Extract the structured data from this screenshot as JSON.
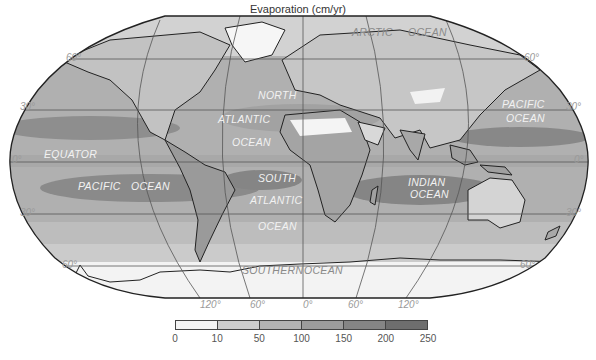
{
  "title": "Evaporation (cm/yr)",
  "map": {
    "projection": "Robinson-like world map",
    "ocean_labels": [
      {
        "id": "arctic",
        "text": "ARCTIC",
        "x": 352,
        "y": 36,
        "style": "dark"
      },
      {
        "id": "arctic-ocean",
        "text": "OCEAN",
        "x": 408,
        "y": 36,
        "style": "dark"
      },
      {
        "id": "north",
        "text": "NORTH",
        "x": 258,
        "y": 99,
        "style": "light"
      },
      {
        "id": "north-atlantic",
        "text": "ATLANTIC",
        "x": 218,
        "y": 123,
        "style": "light"
      },
      {
        "id": "north-ocean",
        "text": "OCEAN",
        "x": 232,
        "y": 146,
        "style": "light"
      },
      {
        "id": "pacific-ne",
        "text": "PACIFIC",
        "x": 502,
        "y": 108,
        "style": "light"
      },
      {
        "id": "pacific-ne-ocean",
        "text": "OCEAN",
        "x": 506,
        "y": 122,
        "style": "light"
      },
      {
        "id": "equator",
        "text": "EQUATOR",
        "x": 44,
        "y": 158,
        "style": "light"
      },
      {
        "id": "pacific",
        "text": "PACIFIC",
        "x": 78,
        "y": 190,
        "style": "light"
      },
      {
        "id": "pacific-ocean",
        "text": "OCEAN",
        "x": 131,
        "y": 190,
        "style": "light"
      },
      {
        "id": "south",
        "text": "SOUTH",
        "x": 258,
        "y": 182,
        "style": "light"
      },
      {
        "id": "south-atlantic",
        "text": "ATLANTIC",
        "x": 250,
        "y": 204,
        "style": "light"
      },
      {
        "id": "south-ocean",
        "text": "OCEAN",
        "x": 258,
        "y": 230,
        "style": "light"
      },
      {
        "id": "indian",
        "text": "INDIAN",
        "x": 408,
        "y": 186,
        "style": "light"
      },
      {
        "id": "indian-ocean",
        "text": "OCEAN",
        "x": 410,
        "y": 198,
        "style": "light"
      },
      {
        "id": "southern",
        "text": "SOUTHERN",
        "x": 242,
        "y": 274,
        "style": "dark"
      },
      {
        "id": "southern-ocean",
        "text": "OCEAN",
        "x": 304,
        "y": 274,
        "style": "dark"
      }
    ],
    "latitude_labels": [
      {
        "text": "60°",
        "x": 66,
        "y": 61
      },
      {
        "text": "30°",
        "x": 20,
        "y": 110
      },
      {
        "text": "0°",
        "x": 12,
        "y": 163
      },
      {
        "text": "30°",
        "x": 20,
        "y": 216
      },
      {
        "text": "60°",
        "x": 62,
        "y": 268
      },
      {
        "text": "60°",
        "x": 524,
        "y": 61
      },
      {
        "text": "30°",
        "x": 566,
        "y": 110
      },
      {
        "text": "0°",
        "x": 574,
        "y": 163
      },
      {
        "text": "30°",
        "x": 566,
        "y": 216
      },
      {
        "text": "60°",
        "x": 520,
        "y": 268
      }
    ],
    "longitude_labels": [
      {
        "text": "120°",
        "x": 200,
        "y": 308
      },
      {
        "text": "60°",
        "x": 250,
        "y": 308
      },
      {
        "text": "0°",
        "x": 303,
        "y": 308
      },
      {
        "text": "60°",
        "x": 348,
        "y": 308
      },
      {
        "text": "120°",
        "x": 398,
        "y": 308
      }
    ]
  },
  "legend": {
    "unit": "cm/yr",
    "bins": [
      {
        "from": 0,
        "to": 10,
        "color": "#f4f4f4"
      },
      {
        "from": 10,
        "to": 50,
        "color": "#cdcdcd"
      },
      {
        "from": 50,
        "to": 100,
        "color": "#b3b3b3"
      },
      {
        "from": 100,
        "to": 150,
        "color": "#9c9c9c"
      },
      {
        "from": 150,
        "to": 200,
        "color": "#858585"
      },
      {
        "from": 200,
        "to": 250,
        "color": "#6e6e6e"
      }
    ],
    "ticks": [
      "0",
      "10",
      "50",
      "100",
      "150",
      "200",
      "250"
    ]
  }
}
